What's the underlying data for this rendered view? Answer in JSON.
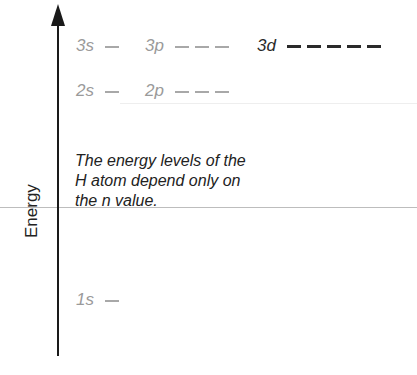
{
  "axis": {
    "label": "Energy"
  },
  "levels": {
    "n3": [
      {
        "label": "3s",
        "orbitals": 1,
        "style": "gray"
      },
      {
        "label": "3p",
        "orbitals": 3,
        "style": "gray"
      },
      {
        "label": "3d",
        "orbitals": 5,
        "style": "dark"
      }
    ],
    "n2": [
      {
        "label": "2s",
        "orbitals": 1,
        "style": "gray"
      },
      {
        "label": "2p",
        "orbitals": 3,
        "style": "gray"
      }
    ],
    "n1": [
      {
        "label": "1s",
        "orbitals": 1,
        "style": "gray"
      }
    ]
  },
  "note": {
    "line1": "The energy levels of the",
    "line2": "H atom depend only on",
    "line3": "the n value."
  }
}
